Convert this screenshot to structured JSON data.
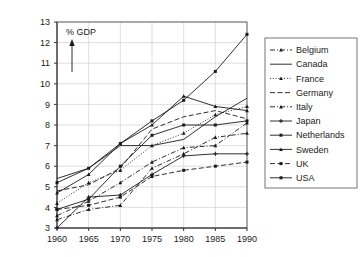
{
  "chart_data": {
    "type": "line",
    "title": "",
    "subtitle": "",
    "xlabel": "",
    "ylabel": "% GDP",
    "axis_note": "% GDP",
    "xlim": [
      1960,
      1990
    ],
    "ylim": [
      3,
      13
    ],
    "x": [
      1960,
      1965,
      1970,
      1975,
      1980,
      1985,
      1990
    ],
    "xticks": [
      "1960",
      "1965",
      "1970",
      "1975",
      "1980",
      "1985",
      "1990"
    ],
    "yticks": [
      "3",
      "4",
      "5",
      "6",
      "7",
      "8",
      "9",
      "10",
      "11",
      "12",
      "13"
    ],
    "grid": true,
    "legend_position": "right",
    "series": [
      {
        "name": "Belgium",
        "values": [
          3.4,
          3.9,
          4.1,
          5.9,
          6.6,
          7.4,
          7.6
        ],
        "style": "dash-dot",
        "marker": "triangle"
      },
      {
        "name": "Canada",
        "values": [
          5.4,
          5.9,
          7.0,
          7.0,
          7.3,
          8.4,
          9.3
        ],
        "style": "solid",
        "marker": "none"
      },
      {
        "name": "France",
        "values": [
          4.2,
          5.2,
          5.8,
          7.0,
          7.6,
          8.5,
          8.9
        ],
        "style": "dotted",
        "marker": "triangle"
      },
      {
        "name": "Germany",
        "values": [
          4.8,
          5.1,
          5.9,
          7.8,
          8.4,
          8.7,
          8.3
        ],
        "style": "dashed",
        "marker": "none"
      },
      {
        "name": "Italy",
        "values": [
          3.6,
          4.3,
          5.2,
          6.2,
          6.9,
          7.0,
          8.1
        ],
        "style": "dash-dot",
        "marker": "triangle"
      },
      {
        "name": "Japan",
        "values": [
          3.0,
          4.5,
          4.6,
          5.6,
          6.5,
          6.6,
          6.6
        ],
        "style": "solid",
        "marker": "plus"
      },
      {
        "name": "Netherlands",
        "values": [
          3.9,
          4.4,
          6.0,
          7.5,
          8.0,
          8.0,
          8.2
        ],
        "style": "solid",
        "marker": "square"
      },
      {
        "name": "Sweden",
        "values": [
          4.7,
          5.6,
          7.1,
          8.0,
          9.4,
          8.9,
          8.7
        ],
        "style": "solid",
        "marker": "triangle"
      },
      {
        "name": "UK",
        "values": [
          3.9,
          4.1,
          4.5,
          5.5,
          5.8,
          6.0,
          6.2
        ],
        "style": "dashed",
        "marker": "square"
      },
      {
        "name": "USA",
        "values": [
          5.2,
          5.9,
          7.1,
          8.2,
          9.2,
          10.6,
          12.4
        ],
        "style": "solid",
        "marker": "square"
      }
    ]
  },
  "legend": {
    "entries": [
      {
        "label": "Belgium"
      },
      {
        "label": "Canada"
      },
      {
        "label": "France"
      },
      {
        "label": "Germany"
      },
      {
        "label": "Italy"
      },
      {
        "label": "Japan"
      },
      {
        "label": "Netherlands"
      },
      {
        "label": "Sweden"
      },
      {
        "label": "UK"
      },
      {
        "label": "USA"
      }
    ]
  },
  "colors": {
    "line": "#1a1a1a",
    "grid": "#c9c9c9",
    "frame": "#555555",
    "background": "#ffffff"
  }
}
